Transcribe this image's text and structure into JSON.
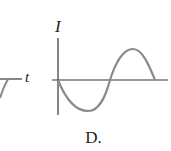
{
  "left_fragment": {
    "axis_label": "t"
  },
  "graph_d": {
    "y_axis_label": "I",
    "x_axis_label": "",
    "caption": "D.",
    "curve": "negative sine, one full period",
    "curve_color": "#8a8a8a",
    "axis_color": "#333333"
  }
}
